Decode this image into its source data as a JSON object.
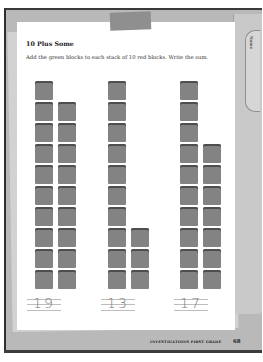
{
  "worksheet": {
    "title": "10 Plus Some",
    "instructions": "Add the green blocks to each stack of 10 red blocks. Write the sum.",
    "tab_label": "Name",
    "problems": [
      {
        "red_blocks": 10,
        "green_blocks": 9,
        "answer": "19"
      },
      {
        "red_blocks": 10,
        "green_blocks": 3,
        "answer": "13"
      },
      {
        "red_blocks": 10,
        "green_blocks": 7,
        "answer": "17"
      }
    ],
    "footer": {
      "series": "INVESTIGATIONS FIRST GRADE",
      "page_number": "68"
    }
  },
  "colors": {
    "block": "#838383",
    "block_edge": "#4e4e4e",
    "folder": "#b9b9b9"
  }
}
